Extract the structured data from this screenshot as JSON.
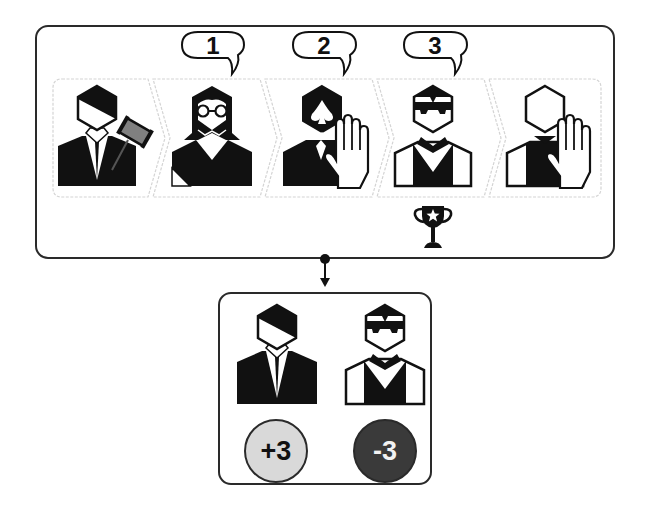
{
  "diagram": {
    "title": "",
    "round": {
      "steps": [
        {
          "id": "judge",
          "role": "judge-with-gavel",
          "icon": "judge-gavel-icon",
          "bubble": null,
          "gesture": null
        },
        {
          "id": "player-glasses",
          "role": "woman-with-glasses",
          "icon": "woman-glasses-icon",
          "bubble": "1",
          "gesture": null
        },
        {
          "id": "player-spade",
          "role": "bearded-man-spade",
          "icon": "spade-beard-icon",
          "bubble": "2",
          "gesture": "raised-hand"
        },
        {
          "id": "dealer",
          "role": "dealer-sunglasses",
          "icon": "dealer-sunglasses-icon",
          "bubble": "3",
          "gesture": null,
          "award": "trophy-star"
        },
        {
          "id": "blank-player",
          "role": "blank-face-person",
          "icon": "blank-person-icon",
          "bubble": null,
          "gesture": "raised-hand"
        }
      ]
    },
    "result": {
      "participants": [
        {
          "id": "judge",
          "icon": "judge-icon",
          "score": "+3",
          "score_fill": "#d9d9d9",
          "score_text_color": "#111111"
        },
        {
          "id": "dealer",
          "icon": "dealer-sunglasses-icon",
          "score": "-3",
          "score_fill": "#3a3a3a",
          "score_text_color": "#f2f2f2"
        }
      ]
    },
    "colors": {
      "stroke": "#2a2a2a",
      "icon_black": "#111111",
      "panel_outline": "#d0d0d0",
      "gavel_gray": "#7a7a7a"
    }
  }
}
